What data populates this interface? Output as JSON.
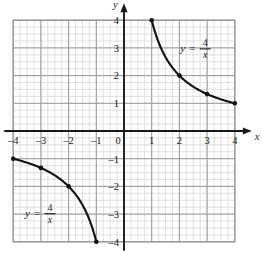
{
  "chart_data": {
    "type": "line",
    "title": "",
    "subtitle": "",
    "xlabel": "x",
    "ylabel": "y",
    "xlim": [
      -4,
      4
    ],
    "ylim": [
      -4,
      4
    ],
    "xticks": [
      "-4",
      "-3",
      "-2",
      "-1",
      "0",
      "1",
      "2",
      "3",
      "4"
    ],
    "xtick_values": [
      -4,
      -3,
      -2,
      -1,
      0,
      1,
      2,
      3,
      4
    ],
    "yticks": [
      "4",
      "3",
      "2",
      "1",
      "0",
      "-1",
      "-2",
      "-3",
      "-4"
    ],
    "ytick_values": [
      4,
      3,
      2,
      1,
      0,
      -1,
      -2,
      -3,
      -4
    ],
    "grid": true,
    "grid_minor_subdivisions": 4,
    "legend_position": "inline-annotation",
    "equation_text": "y = 4/x",
    "equation_numerator": "4",
    "equation_denominator": "x",
    "equation_lhs": "y",
    "equation_eq": "=",
    "annotations": [
      {
        "text": "y = 4/x",
        "x": 2.75,
        "y": 3.0,
        "branch": "quadrant-1"
      },
      {
        "text": "y = 4/x",
        "x": -2.85,
        "y": -2.95,
        "branch": "quadrant-3"
      }
    ],
    "series": [
      {
        "name": "y = 4/x (branch x>0)",
        "color": "#111111",
        "x": [
          1,
          1.25,
          1.5,
          1.75,
          2,
          2.25,
          2.5,
          2.75,
          3,
          3.25,
          3.5,
          3.75,
          4
        ],
        "y": [
          4,
          3.2,
          2.667,
          2.286,
          2,
          1.778,
          1.6,
          1.455,
          1.333,
          1.231,
          1.143,
          1.067,
          1
        ],
        "markers": [
          {
            "x": 1,
            "y": 4
          },
          {
            "x": 2,
            "y": 2
          },
          {
            "x": 3,
            "y": 1.333
          },
          {
            "x": 4,
            "y": 1
          }
        ]
      },
      {
        "name": "y = 4/x (branch x<0)",
        "color": "#111111",
        "x": [
          -4,
          -3.75,
          -3.5,
          -3.25,
          -3,
          -2.75,
          -2.5,
          -2.25,
          -2,
          -1.75,
          -1.5,
          -1.25,
          -1
        ],
        "y": [
          -1,
          -1.067,
          -1.143,
          -1.231,
          -1.333,
          -1.455,
          -1.6,
          -1.778,
          -2,
          -2.286,
          -2.667,
          -3.2,
          -4
        ],
        "markers": [
          {
            "x": -4,
            "y": -1
          },
          {
            "x": -3,
            "y": -1.333
          },
          {
            "x": -2,
            "y": -2
          },
          {
            "x": -1,
            "y": -4
          }
        ]
      }
    ],
    "colors": {
      "background": "#ffffff",
      "curve": "#111111",
      "axis": "#1a1a1a",
      "grid_major": "#999999",
      "grid_minor": "#d8d8d8",
      "text": "#1a1a1a"
    }
  }
}
